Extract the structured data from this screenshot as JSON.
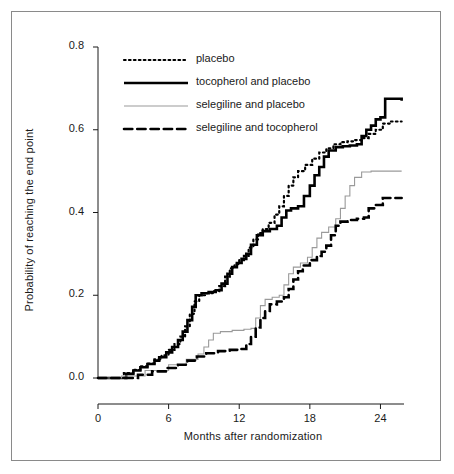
{
  "chart_data": {
    "type": "line",
    "title": "",
    "xlabel": "Months after randomization",
    "ylabel": "Probability of reaching the end point",
    "xlim": [
      0,
      26
    ],
    "ylim": [
      0,
      0.8
    ],
    "xticks": [
      0,
      6,
      12,
      18,
      24
    ],
    "xticklabels": [
      "0",
      "6",
      "12",
      "18",
      "24"
    ],
    "yticks": [
      0.0,
      0.2,
      0.4,
      0.6,
      0.8
    ],
    "yticklabels": [
      "0.0",
      "0.2",
      "0.4",
      "0.6",
      "0.8"
    ],
    "grid": false,
    "legend_position": "top-left",
    "step_type": "post",
    "series": [
      {
        "name": "placebo",
        "style": "dotted",
        "color": "#000000",
        "width": 2.2,
        "end_value": 0.62,
        "points": [
          [
            0,
            0.0
          ],
          [
            1.6,
            0.0
          ],
          [
            2.2,
            0.012
          ],
          [
            3.0,
            0.02
          ],
          [
            3.6,
            0.028
          ],
          [
            4.2,
            0.035
          ],
          [
            4.8,
            0.045
          ],
          [
            5.4,
            0.055
          ],
          [
            6.0,
            0.068
          ],
          [
            6.5,
            0.082
          ],
          [
            7.0,
            0.1
          ],
          [
            7.4,
            0.125
          ],
          [
            7.8,
            0.155
          ],
          [
            8.2,
            0.185
          ],
          [
            8.6,
            0.2
          ],
          [
            9.2,
            0.205
          ],
          [
            9.8,
            0.21
          ],
          [
            10.3,
            0.222
          ],
          [
            10.8,
            0.245
          ],
          [
            11.2,
            0.265
          ],
          [
            11.6,
            0.275
          ],
          [
            12.0,
            0.285
          ],
          [
            12.4,
            0.295
          ],
          [
            12.8,
            0.315
          ],
          [
            13.2,
            0.335
          ],
          [
            13.6,
            0.35
          ],
          [
            14.0,
            0.36
          ],
          [
            14.5,
            0.375
          ],
          [
            15.0,
            0.395
          ],
          [
            15.4,
            0.415
          ],
          [
            15.8,
            0.44
          ],
          [
            16.2,
            0.465
          ],
          [
            16.6,
            0.485
          ],
          [
            17.0,
            0.5
          ],
          [
            17.6,
            0.515
          ],
          [
            18.2,
            0.53
          ],
          [
            18.8,
            0.545
          ],
          [
            19.4,
            0.555
          ],
          [
            20.0,
            0.565
          ],
          [
            20.6,
            0.57
          ],
          [
            21.2,
            0.572
          ],
          [
            21.8,
            0.575
          ],
          [
            22.4,
            0.58
          ],
          [
            23.0,
            0.59
          ],
          [
            23.6,
            0.6
          ],
          [
            24.2,
            0.615
          ],
          [
            24.8,
            0.62
          ],
          [
            25.8,
            0.62
          ]
        ]
      },
      {
        "name": "tocopherol and placebo",
        "style": "solid",
        "color": "#000000",
        "width": 2.6,
        "end_value": 0.67,
        "points": [
          [
            0,
            0.0
          ],
          [
            1.8,
            0.0
          ],
          [
            2.4,
            0.01
          ],
          [
            3.0,
            0.018
          ],
          [
            3.6,
            0.026
          ],
          [
            4.2,
            0.034
          ],
          [
            4.8,
            0.042
          ],
          [
            5.2,
            0.05
          ],
          [
            5.8,
            0.062
          ],
          [
            6.3,
            0.075
          ],
          [
            6.8,
            0.092
          ],
          [
            7.2,
            0.112
          ],
          [
            7.6,
            0.14
          ],
          [
            8.0,
            0.172
          ],
          [
            8.3,
            0.2
          ],
          [
            8.8,
            0.205
          ],
          [
            9.4,
            0.208
          ],
          [
            10.0,
            0.212
          ],
          [
            10.5,
            0.228
          ],
          [
            11.0,
            0.252
          ],
          [
            11.4,
            0.268
          ],
          [
            11.8,
            0.278
          ],
          [
            12.2,
            0.288
          ],
          [
            12.6,
            0.3
          ],
          [
            13.0,
            0.322
          ],
          [
            13.5,
            0.345
          ],
          [
            14.0,
            0.355
          ],
          [
            14.6,
            0.36
          ],
          [
            15.2,
            0.368
          ],
          [
            15.6,
            0.388
          ],
          [
            16.0,
            0.405
          ],
          [
            16.4,
            0.41
          ],
          [
            17.0,
            0.415
          ],
          [
            17.5,
            0.44
          ],
          [
            18.0,
            0.465
          ],
          [
            18.4,
            0.49
          ],
          [
            18.8,
            0.51
          ],
          [
            19.2,
            0.535
          ],
          [
            19.6,
            0.55
          ],
          [
            20.2,
            0.558
          ],
          [
            20.8,
            0.56
          ],
          [
            21.4,
            0.562
          ],
          [
            22.0,
            0.565
          ],
          [
            22.4,
            0.585
          ],
          [
            22.8,
            0.6
          ],
          [
            23.2,
            0.61
          ],
          [
            23.6,
            0.625
          ],
          [
            24.0,
            0.63
          ],
          [
            24.4,
            0.675
          ],
          [
            25.8,
            0.67
          ]
        ]
      },
      {
        "name": "selegiline and placebo",
        "style": "solid",
        "color": "#9a9a9a",
        "width": 1.1,
        "end_value": 0.5,
        "points": [
          [
            0,
            0.0
          ],
          [
            2.0,
            0.005
          ],
          [
            4.0,
            0.018
          ],
          [
            6.0,
            0.032
          ],
          [
            7.5,
            0.045
          ],
          [
            8.5,
            0.058
          ],
          [
            9.0,
            0.075
          ],
          [
            9.4,
            0.092
          ],
          [
            9.8,
            0.108
          ],
          [
            10.4,
            0.112
          ],
          [
            11.4,
            0.115
          ],
          [
            12.4,
            0.118
          ],
          [
            13.0,
            0.12
          ],
          [
            13.4,
            0.145
          ],
          [
            13.8,
            0.175
          ],
          [
            14.2,
            0.19
          ],
          [
            14.8,
            0.195
          ],
          [
            15.4,
            0.2
          ],
          [
            15.8,
            0.225
          ],
          [
            16.2,
            0.252
          ],
          [
            16.6,
            0.268
          ],
          [
            17.2,
            0.278
          ],
          [
            17.8,
            0.292
          ],
          [
            18.2,
            0.315
          ],
          [
            18.6,
            0.338
          ],
          [
            19.0,
            0.352
          ],
          [
            19.6,
            0.365
          ],
          [
            20.2,
            0.385
          ],
          [
            20.6,
            0.41
          ],
          [
            21.0,
            0.44
          ],
          [
            21.4,
            0.465
          ],
          [
            21.8,
            0.485
          ],
          [
            22.4,
            0.498
          ],
          [
            23.2,
            0.5
          ],
          [
            25.8,
            0.5
          ]
        ]
      },
      {
        "name": "selegiline and tocopherol",
        "style": "dashed",
        "color": "#000000",
        "width": 2.6,
        "end_value": 0.435,
        "points": [
          [
            0,
            0.0
          ],
          [
            2.4,
            0.0
          ],
          [
            3.4,
            0.008
          ],
          [
            4.6,
            0.016
          ],
          [
            5.8,
            0.024
          ],
          [
            6.8,
            0.032
          ],
          [
            7.6,
            0.042
          ],
          [
            8.4,
            0.052
          ],
          [
            9.2,
            0.06
          ],
          [
            10.2,
            0.065
          ],
          [
            11.2,
            0.068
          ],
          [
            12.0,
            0.07
          ],
          [
            12.6,
            0.082
          ],
          [
            13.0,
            0.1
          ],
          [
            13.4,
            0.122
          ],
          [
            13.8,
            0.145
          ],
          [
            14.2,
            0.162
          ],
          [
            14.6,
            0.178
          ],
          [
            15.2,
            0.185
          ],
          [
            15.8,
            0.195
          ],
          [
            16.2,
            0.215
          ],
          [
            16.6,
            0.238
          ],
          [
            17.0,
            0.258
          ],
          [
            17.4,
            0.272
          ],
          [
            18.0,
            0.285
          ],
          [
            18.6,
            0.295
          ],
          [
            19.0,
            0.305
          ],
          [
            19.4,
            0.32
          ],
          [
            19.8,
            0.345
          ],
          [
            20.2,
            0.368
          ],
          [
            20.6,
            0.378
          ],
          [
            21.2,
            0.382
          ],
          [
            22.0,
            0.385
          ],
          [
            22.6,
            0.388
          ],
          [
            23.0,
            0.41
          ],
          [
            23.6,
            0.418
          ],
          [
            24.2,
            0.435
          ],
          [
            25.8,
            0.435
          ]
        ]
      }
    ]
  },
  "legend": {
    "items": [
      {
        "label": "placebo"
      },
      {
        "label": "tocopherol and placebo"
      },
      {
        "label": "selegiline and placebo"
      },
      {
        "label": "selegiline and tocopherol"
      }
    ]
  }
}
